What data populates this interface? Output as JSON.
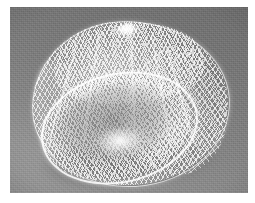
{
  "image": {
    "title": "Photograph of a white mesh net bag",
    "subject": "mesh net / hairnet",
    "medium": "black and white photograph",
    "caption": "",
    "dimensions": {
      "width": 255,
      "height": 203
    }
  },
  "plate": {
    "left": 10,
    "top": 7,
    "width": 238,
    "height": 186,
    "margin_color": "#ffffff"
  },
  "palette": {
    "page": "#ffffff",
    "backdrop_light": "#8a8a8a",
    "backdrop_mid": "#7d7d7d",
    "backdrop_dark": "#6e6e6e",
    "net_white": "#ffffff",
    "net_shade": "#b8b8b8",
    "shadow": "#3c3c3c"
  },
  "object": {
    "name": "net-bag",
    "outline_label": "bag-silhouette",
    "parts": [
      {
        "name": "top-knot",
        "label": "gathered tuft at top"
      },
      {
        "name": "dome-mesh",
        "label": "diamond mesh dome"
      },
      {
        "name": "mouth-opening",
        "label": "open elliptical mouth"
      },
      {
        "name": "mouth-rim",
        "label": "bright rim highlight"
      },
      {
        "name": "bottom-burst",
        "label": "bright gather point at base"
      },
      {
        "name": "cast-shadow",
        "label": "shadow on backdrop"
      }
    ]
  }
}
